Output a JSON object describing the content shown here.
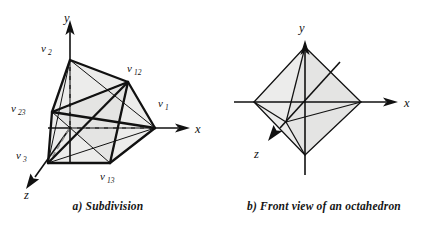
{
  "figure": {
    "panels": [
      {
        "id": "a",
        "caption": "a) Subdivision",
        "axes": [
          {
            "name": "y-axis",
            "label": "y"
          },
          {
            "name": "x-axis",
            "label": "x"
          },
          {
            "name": "z-axis",
            "label": "z"
          }
        ],
        "vertex_labels": [
          {
            "name": "v2",
            "base": "v",
            "sub": "2"
          },
          {
            "name": "v12",
            "base": "v",
            "sub": "12"
          },
          {
            "name": "v23",
            "base": "v",
            "sub": "23"
          },
          {
            "name": "v1",
            "base": "v",
            "sub": "1"
          },
          {
            "name": "v3",
            "base": "v",
            "sub": "3"
          },
          {
            "name": "v13",
            "base": "v",
            "sub": "13"
          }
        ]
      },
      {
        "id": "b",
        "caption": "b) Front view of an octahedron",
        "axes": [
          {
            "name": "y-axis",
            "label": "y"
          },
          {
            "name": "x-axis",
            "label": "x"
          },
          {
            "name": "z-axis",
            "label": "z"
          }
        ],
        "vertex_labels": []
      }
    ],
    "colors": {
      "background": "#ffffff",
      "ink": "#111111",
      "face_fill": "#ececeb",
      "hidden_edge": "#8d8d8d"
    }
  }
}
